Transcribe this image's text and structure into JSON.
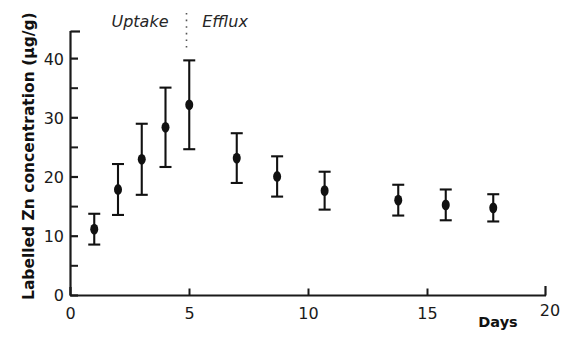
{
  "chart_data": {
    "type": "scatter",
    "title": "",
    "subtitle": "",
    "xlabel": "Days",
    "ylabel": "Labelled Zn concentration (μg/g)",
    "xlim": [
      0,
      20
    ],
    "ylim": [
      0,
      45
    ],
    "grid": false,
    "legend_position": "none",
    "x_ticks": [
      0,
      5,
      10,
      15,
      20
    ],
    "x_tick_labels": [
      "0",
      "5",
      "10",
      "15",
      "20"
    ],
    "x_minor_ticks": [],
    "y_ticks": [
      0,
      10,
      20,
      30,
      40
    ],
    "y_tick_labels": [
      "0",
      "10",
      "20",
      "30",
      "40"
    ],
    "y_minor_ticks": [
      5,
      15,
      25,
      35,
      45
    ],
    "error_bar_style": "symmetric-capped",
    "marker": "filled-circle",
    "marker_color": "#111111",
    "series": [
      {
        "name": "Labelled Zn concentration",
        "points": [
          {
            "x": 1.0,
            "y": 11.2,
            "err_low": 2.6,
            "err_high": 2.6,
            "phase": "Uptake"
          },
          {
            "x": 2.0,
            "y": 17.9,
            "err_low": 4.3,
            "err_high": 4.3,
            "phase": "Uptake"
          },
          {
            "x": 3.0,
            "y": 23.0,
            "err_low": 6.0,
            "err_high": 6.0,
            "phase": "Uptake"
          },
          {
            "x": 4.0,
            "y": 28.4,
            "err_low": 6.7,
            "err_high": 6.7,
            "phase": "Uptake"
          },
          {
            "x": 5.0,
            "y": 32.2,
            "err_low": 7.5,
            "err_high": 7.5,
            "phase": "Uptake"
          },
          {
            "x": 7.0,
            "y": 23.2,
            "err_low": 4.2,
            "err_high": 4.2,
            "phase": "Efflux"
          },
          {
            "x": 8.7,
            "y": 20.1,
            "err_low": 3.4,
            "err_high": 3.4,
            "phase": "Efflux"
          },
          {
            "x": 10.7,
            "y": 17.7,
            "err_low": 3.2,
            "err_high": 3.2,
            "phase": "Efflux"
          },
          {
            "x": 13.8,
            "y": 16.1,
            "err_low": 2.6,
            "err_high": 2.6,
            "phase": "Efflux"
          },
          {
            "x": 15.8,
            "y": 15.3,
            "err_low": 2.6,
            "err_high": 2.6,
            "phase": "Efflux"
          },
          {
            "x": 17.8,
            "y": 14.8,
            "err_low": 2.3,
            "err_high": 2.3,
            "phase": "Efflux"
          }
        ]
      }
    ],
    "annotations": [
      {
        "name": "uptake-label",
        "text": "Uptake",
        "x": 3.0,
        "y": 44.5,
        "style": "italic"
      },
      {
        "name": "efflux-label",
        "text": "Efflux",
        "x": 7.6,
        "y": 44.5,
        "style": "italic"
      },
      {
        "name": "phase-divider",
        "text": "",
        "x": 4.85,
        "y": 44.0,
        "style": "dotted-vertical"
      }
    ]
  },
  "axes": {
    "y_label": "Labelled Zn concentration (μg/g)",
    "x_label": "Days",
    "y_tick_0": "0",
    "y_tick_10": "10",
    "y_tick_20": "20",
    "y_tick_30": "30",
    "y_tick_40": "40",
    "x_tick_0": "0",
    "x_tick_5": "5",
    "x_tick_10": "10",
    "x_tick_15": "15",
    "x_tick_20": "20"
  },
  "labels": {
    "uptake": "Uptake",
    "efflux": "Efflux"
  },
  "colors": {
    "marker": "#111111",
    "axis": "#1a1a1a",
    "background": "#ffffff",
    "text": "#1a1a1a"
  }
}
